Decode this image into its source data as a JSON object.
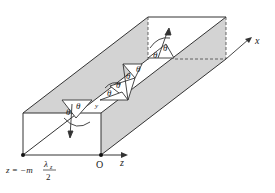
{
  "figure": {
    "colors": {
      "wall": "#d0d0d0",
      "line": "#333333",
      "floor": "#ffffff"
    },
    "labels": {
      "x_axis": "x",
      "z_axis": "z",
      "origin": "O",
      "y_marker": "y",
      "theta": "θ",
      "theta_i": "θ",
      "sub_i": "i",
      "sub_r": "r",
      "position_left": "z = −m",
      "fraction_num": "λ",
      "fraction_num_sub": "z",
      "fraction_den": "2"
    }
  }
}
